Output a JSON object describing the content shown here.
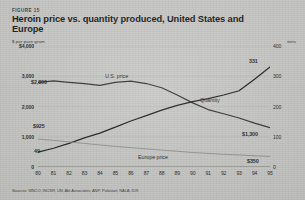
{
  "figure": {
    "number_label": "FIGURE 15",
    "title": "Heroin price vs. quantity produced, United States and Europe",
    "source": "Sources: MNCO; INCSR; UN; Abt Associates; ANP; Pakistan; NALA; IDR"
  },
  "axes": {
    "left_unit": "$ per pure gram",
    "right_unit": "tons",
    "left_ticks": [
      "$4,000",
      "3,000",
      "2,000",
      "1,000",
      "0"
    ],
    "left_values": [
      4000,
      3000,
      2000,
      1000,
      0
    ],
    "right_ticks": [
      "400",
      "300",
      "200",
      "100",
      "0"
    ],
    "right_values": [
      400,
      300,
      200,
      100,
      0
    ],
    "x_ticks": [
      "80",
      "81",
      "82",
      "83",
      "84",
      "85",
      "86",
      "87",
      "88",
      "89",
      "90",
      "91",
      "92",
      "93",
      "94",
      "95"
    ]
  },
  "annotations": {
    "us_price_series": "U.S. price",
    "quantity_series": "Quantity",
    "europe_price_series": "Europe price",
    "us_price_start": "$2,800",
    "us_price_end": "$1,300",
    "europe_price_start": "$925",
    "europe_price_end": "$350",
    "quantity_start": "49",
    "quantity_end": "331"
  },
  "colors": {
    "background": "#c9c9c7",
    "ink": "#1a1a1a",
    "us_price_line": "#2b2b2b",
    "quantity_line": "#171717",
    "europe_price_line": "#8c8c8a"
  },
  "chart_data": {
    "type": "line",
    "title": "Heroin price vs. quantity produced, United States and Europe",
    "subtitle": "FIGURE 15",
    "xlabel": "",
    "ylabel": "$ per pure gram",
    "y2label": "tons",
    "x": [
      1980,
      1981,
      1982,
      1983,
      1984,
      1985,
      1986,
      1987,
      1988,
      1989,
      1990,
      1991,
      1992,
      1993,
      1994,
      1995
    ],
    "xtick_labels": [
      "80",
      "81",
      "82",
      "83",
      "84",
      "85",
      "86",
      "87",
      "88",
      "89",
      "90",
      "91",
      "92",
      "93",
      "94",
      "95"
    ],
    "ylim": [
      0,
      4000
    ],
    "y2lim": [
      0,
      400
    ],
    "grid": false,
    "legend": "inline-annotations",
    "series": [
      {
        "name": "U.S. price",
        "axis": "left",
        "unit": "$ per pure gram",
        "color": "#2b2b2b",
        "start_label": "$2,800",
        "end_label": "$1,300",
        "values": [
          2800,
          2850,
          2800,
          2760,
          2700,
          2800,
          2840,
          2760,
          2620,
          2380,
          2120,
          1900,
          1760,
          1620,
          1450,
          1300
        ]
      },
      {
        "name": "Quantity",
        "axis": "right",
        "unit": "tons",
        "color": "#171717",
        "start_label": "49",
        "end_label": "331",
        "values": [
          49,
          62,
          78,
          96,
          112,
          132,
          152,
          170,
          188,
          204,
          216,
          226,
          238,
          252,
          290,
          331
        ]
      },
      {
        "name": "Europe price",
        "axis": "left",
        "unit": "$ per pure gram",
        "color": "#8c8c8a",
        "start_label": "$925",
        "end_label": "$350",
        "values": [
          925,
          880,
          830,
          780,
          730,
          680,
          640,
          600,
          560,
          520,
          480,
          450,
          420,
          400,
          370,
          350
        ]
      }
    ]
  }
}
